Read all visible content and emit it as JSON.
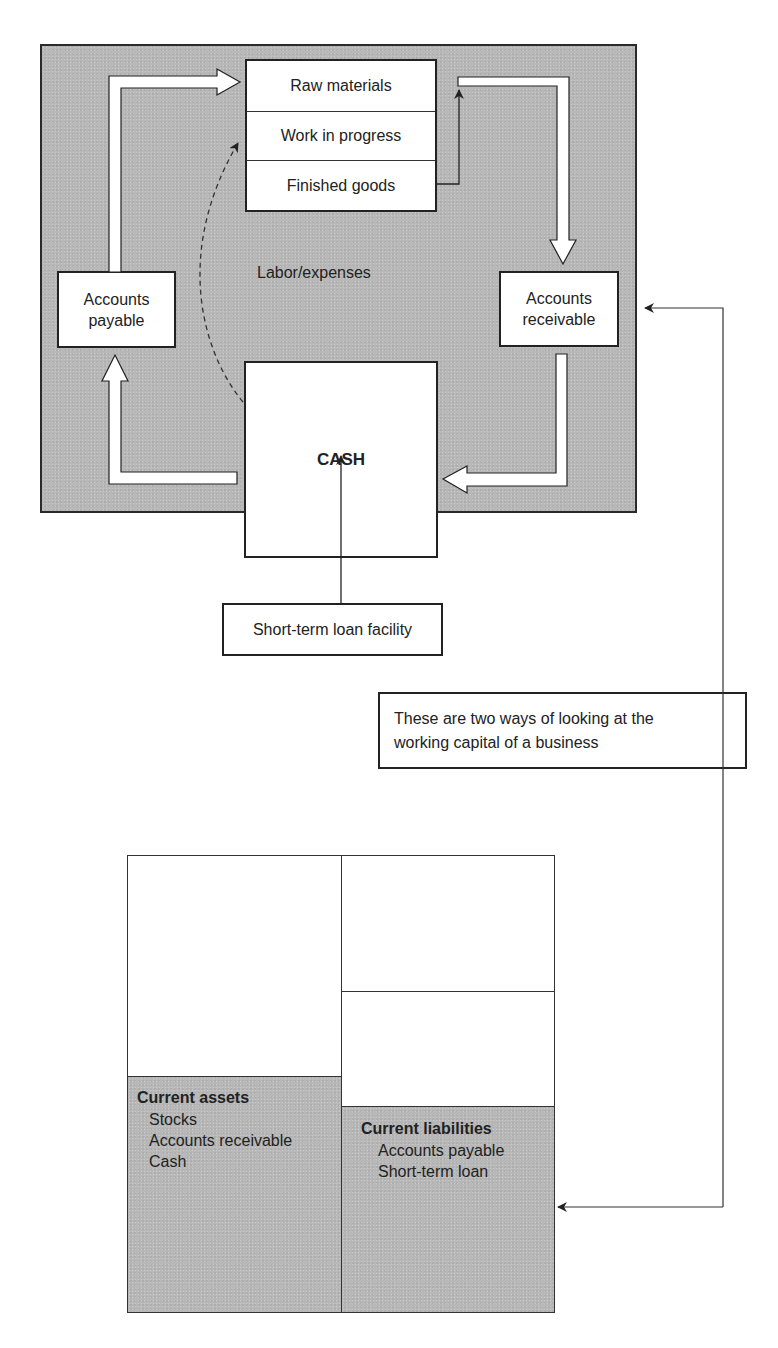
{
  "cycle": {
    "inventory": {
      "rows": [
        "Raw materials",
        "Work in progress",
        "Finished goods"
      ]
    },
    "accounts_payable": {
      "line1": "Accounts",
      "line2": "payable"
    },
    "accounts_receivable": {
      "line1": "Accounts",
      "line2": "receivable"
    },
    "cash": "CASH",
    "labor_label": "Labor/expenses",
    "loan_facility": "Short-term loan facility"
  },
  "note": {
    "line1": "These are two ways of looking at the",
    "line2": "working capital of a business"
  },
  "balance_sheet": {
    "current_assets": {
      "title": "Current assets",
      "items": [
        "Stocks",
        "Accounts receivable",
        "Cash"
      ]
    },
    "current_liabilities": {
      "title": "Current liabilities",
      "items": [
        "Accounts payable",
        "Short-term loan"
      ]
    }
  },
  "colors": {
    "panel_gray": "#b8b8b8",
    "stroke": "#222222",
    "box_fill": "#ffffff"
  }
}
